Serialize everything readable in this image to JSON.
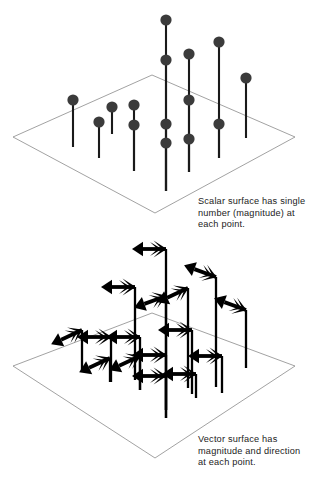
{
  "figure": {
    "title_visible": false,
    "background_color": "#ffffff",
    "panels": [
      {
        "id": "scalar-panel",
        "name": "scalar-surface-panel",
        "caption": "Scalar surface has single\nnumber (magnitude) at\neach point.",
        "plane": {
          "stroke_color": "#8a8a8a",
          "stroke_width": 0.8,
          "corners": [
            [
              152,
              75
            ],
            [
              295,
              137
            ],
            [
              155,
              213
            ],
            [
              13,
              137
            ]
          ]
        },
        "marker": {
          "type": "ball-on-stem",
          "ball_color": "#3b3b3b",
          "ball_radius": 5.6,
          "stem_color": "#1a1a1a",
          "stem_width": 2.1
        },
        "markers": [
          {
            "x": 73,
            "ball_y": 100,
            "stem_bottom": 147
          },
          {
            "x": 99,
            "ball_y": 122,
            "stem_bottom": 158
          },
          {
            "x": 112,
            "ball_y": 107,
            "stem_bottom": 134
          },
          {
            "x": 134,
            "ball_y": 105,
            "stem_bottom": 171
          },
          {
            "x": 134,
            "ball_y": 125,
            "stem_bottom": 171
          },
          {
            "x": 166,
            "ball_y": 20,
            "stem_bottom": 191
          },
          {
            "x": 166,
            "ball_y": 60,
            "stem_bottom": 191
          },
          {
            "x": 166,
            "ball_y": 124,
            "stem_bottom": 191
          },
          {
            "x": 166,
            "ball_y": 143,
            "stem_bottom": 191
          },
          {
            "x": 189,
            "ball_y": 54,
            "stem_bottom": 172
          },
          {
            "x": 189,
            "ball_y": 100,
            "stem_bottom": 172
          },
          {
            "x": 189,
            "ball_y": 139,
            "stem_bottom": 172
          },
          {
            "x": 219,
            "ball_y": 42,
            "stem_bottom": 158
          },
          {
            "x": 219,
            "ball_y": 124,
            "stem_bottom": 158
          },
          {
            "x": 246,
            "ball_y": 78,
            "stem_bottom": 138
          }
        ]
      },
      {
        "id": "vector-panel",
        "name": "vector-surface-panel",
        "caption": "Vector surface has\nmagnitude and direction\nat each point.",
        "plane": {
          "stroke_color": "#8a8a8a",
          "stroke_width": 0.8,
          "corners": [
            [
              152,
              313
            ],
            [
              295,
              366
            ],
            [
              155,
              458
            ],
            [
              13,
              366
            ]
          ]
        },
        "marker": {
          "type": "arrow-on-stem",
          "arrow_color": "#000000",
          "stem_color": "#000000",
          "stem_width": 2.3,
          "arrow_length": 34
        },
        "markers": [
          {
            "x": 166,
            "arrow_y": 249,
            "stem_bottom": 410,
            "angle": 180
          },
          {
            "x": 135,
            "arrow_y": 287,
            "stem_bottom": 380,
            "angle": 180
          },
          {
            "x": 166,
            "arrow_y": 296,
            "stem_bottom": 410,
            "angle": 200
          },
          {
            "x": 188,
            "arrow_y": 288,
            "stem_bottom": 388,
            "angle": 205
          },
          {
            "x": 216,
            "arrow_y": 277,
            "stem_bottom": 387,
            "angle": 160
          },
          {
            "x": 246,
            "arrow_y": 310,
            "stem_bottom": 368,
            "angle": 160
          },
          {
            "x": 82,
            "arrow_y": 330,
            "stem_bottom": 370,
            "angle": 205
          },
          {
            "x": 111,
            "arrow_y": 337,
            "stem_bottom": 382,
            "angle": 180
          },
          {
            "x": 140,
            "arrow_y": 337,
            "stem_bottom": 390,
            "angle": 180
          },
          {
            "x": 192,
            "arrow_y": 330,
            "stem_bottom": 394,
            "angle": 180
          },
          {
            "x": 110,
            "arrow_y": 358,
            "stem_bottom": 382,
            "angle": 205
          },
          {
            "x": 140,
            "arrow_y": 356,
            "stem_bottom": 390,
            "angle": 205
          },
          {
            "x": 166,
            "arrow_y": 355,
            "stem_bottom": 418,
            "angle": 180
          },
          {
            "x": 222,
            "arrow_y": 356,
            "stem_bottom": 393,
            "angle": 180
          },
          {
            "x": 166,
            "arrow_y": 376,
            "stem_bottom": 418,
            "angle": 180
          },
          {
            "x": 196,
            "arrow_y": 374,
            "stem_bottom": 398,
            "angle": 180
          }
        ]
      }
    ]
  },
  "chart_data": {
    "type": "scatter",
    "xlabel": "",
    "ylabel": "",
    "grid": false,
    "legend": null,
    "annotations": [
      "Scalar surface has single number (magnitude) at each point.",
      "Vector surface has magnitude and direction at each point."
    ],
    "series": [
      {
        "name": "Scalar surface samples",
        "glyph": "ball-on-stem",
        "description": "Pins rising from a planar grid; each pin carries a single ball representing a magnitude only.",
        "count": 15
      },
      {
        "name": "Vector surface samples",
        "glyph": "arrow-on-stem",
        "description": "Pins rising from a planar grid; each pin carries an arrow representing both magnitude and direction.",
        "count": 16
      }
    ]
  }
}
